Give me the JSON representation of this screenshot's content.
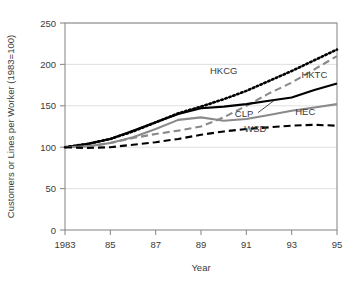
{
  "chart_data": {
    "type": "line",
    "title": "",
    "xlabel": "Year",
    "ylabel": "Customers or Lines per Worker (1983=100)",
    "xlim": [
      1983,
      1995
    ],
    "ylim": [
      0,
      250
    ],
    "ytick_labels": [
      "0",
      "50",
      "100",
      "150",
      "200",
      "250"
    ],
    "yticks": [
      0,
      50,
      100,
      150,
      200,
      250
    ],
    "xtick_labels": [
      "1983",
      "85",
      "87",
      "89",
      "91",
      "93",
      "95"
    ],
    "xticks": [
      1983,
      1985,
      1987,
      1989,
      1991,
      1993,
      1995
    ],
    "grid": "horizontal",
    "legend_position": "inline-labels",
    "x": [
      1983,
      1984,
      1985,
      1986,
      1987,
      1988,
      1989,
      1990,
      1991,
      1992,
      1993,
      1994,
      1995
    ],
    "series": [
      {
        "name": "HKCG",
        "style": "dotted",
        "color": "#000000",
        "values": [
          100,
          104,
          110,
          119,
          130,
          141,
          149,
          158,
          168,
          180,
          192,
          205,
          218
        ]
      },
      {
        "name": "HKTC",
        "style": "dashed",
        "color": "#8a8a8a",
        "values": [
          100,
          101,
          105,
          111,
          116,
          120,
          125,
          136,
          150,
          165,
          178,
          194,
          210
        ]
      },
      {
        "name": "CLP",
        "style": "solid",
        "color": "#000000",
        "values": [
          100,
          104,
          110,
          120,
          130,
          140,
          147,
          149,
          152,
          156,
          160,
          169,
          177
        ]
      },
      {
        "name": "HEC",
        "style": "solid",
        "color": "#8a8a8a",
        "values": [
          100,
          101,
          105,
          112,
          122,
          133,
          136,
          132,
          134,
          139,
          144,
          148,
          152
        ]
      },
      {
        "name": "WSD",
        "style": "dashed",
        "color": "#000000",
        "values": [
          100,
          99,
          100,
          103,
          106,
          110,
          115,
          119,
          122,
          124,
          126,
          127,
          126
        ]
      }
    ],
    "annotations": [
      {
        "label": "HKCG",
        "x": 1990.0,
        "y": 188,
        "leader": false
      },
      {
        "label": "HKTC",
        "x": 1994.0,
        "y": 183,
        "leader": false
      },
      {
        "label": "CLP",
        "x": 1990.9,
        "y": 137,
        "leader": true
      },
      {
        "label": "HEC",
        "x": 1993.6,
        "y": 139,
        "leader": false
      },
      {
        "label": "WSD",
        "x": 1991.4,
        "y": 118,
        "leader": false
      }
    ]
  }
}
